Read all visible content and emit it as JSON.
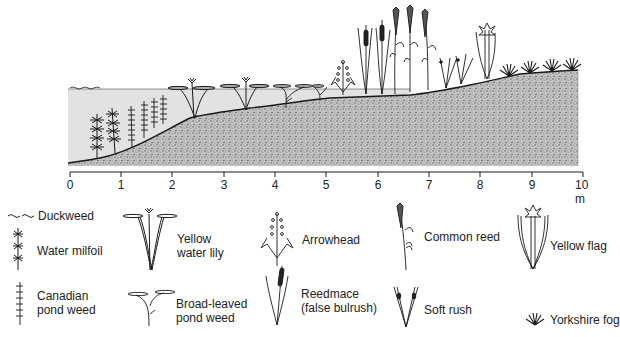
{
  "diagram": {
    "type": "cross-section of pond margin showing plant zonation",
    "scale": {
      "ticks": [
        "0",
        "1",
        "2",
        "3",
        "4",
        "5",
        "6",
        "7",
        "8",
        "9",
        "10 m"
      ],
      "unit": "m"
    },
    "zones_in_profile": [
      {
        "plant": "Duckweed",
        "position_m": "0-1",
        "location": "water surface"
      },
      {
        "plant": "Water milfoil",
        "position_m": "0.5-1",
        "location": "submerged"
      },
      {
        "plant": "Canadian pond weed",
        "position_m": "1-2",
        "location": "submerged"
      },
      {
        "plant": "Yellow water lily",
        "position_m": "2-4",
        "location": "floating leaves"
      },
      {
        "plant": "Broad-leaved pond weed",
        "position_m": "4-5",
        "location": "floating leaves"
      },
      {
        "plant": "Arrowhead",
        "position_m": "5",
        "location": "shallow margin"
      },
      {
        "plant": "Reedmace (false bulrush)",
        "position_m": "5.5-6",
        "location": "shallow margin"
      },
      {
        "plant": "Common reed",
        "position_m": "6-7",
        "location": "water edge"
      },
      {
        "plant": "Soft rush",
        "position_m": "7-8",
        "location": "damp bank"
      },
      {
        "plant": "Yellow flag",
        "position_m": "8",
        "location": "damp bank"
      },
      {
        "plant": "Yorkshire fog",
        "position_m": "8.5-10",
        "location": "dry bank"
      }
    ]
  },
  "legend": {
    "items": [
      {
        "id": "duckweed",
        "label": "Duckweed"
      },
      {
        "id": "water-milfoil",
        "label": "Water milfoil"
      },
      {
        "id": "canadian-pond-weed",
        "label_line1": "Canadian",
        "label_line2": "pond weed"
      },
      {
        "id": "yellow-water-lily",
        "label_line1": "Yellow",
        "label_line2": "water lily"
      },
      {
        "id": "broad-leaved-pond-weed",
        "label_line1": "Broad-leaved",
        "label_line2": "pond weed"
      },
      {
        "id": "arrowhead",
        "label": "Arrowhead"
      },
      {
        "id": "reedmace",
        "label_line1": "Reedmace",
        "label_line2": "(false bulrush)"
      },
      {
        "id": "common-reed",
        "label": "Common reed"
      },
      {
        "id": "soft-rush",
        "label": "Soft rush"
      },
      {
        "id": "yellow-flag",
        "label": "Yellow flag"
      },
      {
        "id": "yorkshire-fog",
        "label": "Yorkshire fog"
      }
    ]
  },
  "colors": {
    "ink": "#1a1a1a",
    "water": "#e4e4e4",
    "soil": "#b8b8b8"
  }
}
